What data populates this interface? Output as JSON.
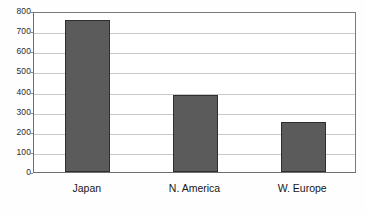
{
  "chart_data": {
    "type": "bar",
    "title": "",
    "subtitle": "",
    "xlabel": "",
    "ylabel": "",
    "categories": [
      "Japan",
      "N. America",
      "W. Europe"
    ],
    "values": [
      755,
      385,
      250
    ],
    "series": [
      {
        "name": "",
        "values": [
          755,
          385,
          250
        ]
      }
    ],
    "ylim": [
      0,
      800
    ],
    "ytick_values": [
      0,
      100,
      200,
      300,
      400,
      500,
      600,
      700,
      800
    ],
    "ytick_labels": [
      "0",
      "100",
      "200",
      "300",
      "400",
      "500",
      "600",
      "700",
      "800"
    ],
    "grid": true,
    "grid_axis": "y",
    "legend": false,
    "legend_position": "none",
    "annotations": [],
    "colors": {
      "bar_fill": "#5b5b5b",
      "bar_border": "#2e2e2e",
      "gridline": "#c9c9c9",
      "plot_border": "#6d6d6d",
      "background": "#fefefe",
      "tick_text": "#2b2b2b",
      "category_text": "#161616"
    }
  }
}
